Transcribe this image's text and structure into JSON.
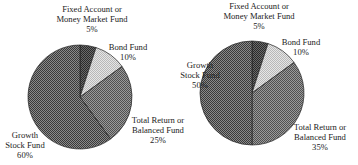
{
  "chart_data": [
    {
      "type": "pie",
      "title": "",
      "center": [
        80,
        97
      ],
      "radius": 52,
      "start_angle_deg": 0,
      "slices": [
        {
          "label": "Fixed Account or Money Market Fund",
          "value": 5,
          "pattern": "dark"
        },
        {
          "label": "Bond Fund",
          "value": 10,
          "pattern": "light"
        },
        {
          "label": "Total Return or Balanced Fund",
          "value": 25,
          "pattern": "medium"
        },
        {
          "label": "Growth Stock Fund",
          "value": 60,
          "pattern": "darkmed"
        }
      ],
      "labels": [
        {
          "lines": [
            "Fixed Account or",
            "Money Market Fund",
            "5%"
          ],
          "x": 92,
          "y": 12,
          "anchor": "middle"
        },
        {
          "lines": [
            "Bond Fund",
            "10%"
          ],
          "x": 128,
          "y": 50,
          "anchor": "middle"
        },
        {
          "lines": [
            "Total Return or",
            "Balanced Fund",
            "25%"
          ],
          "x": 158,
          "y": 123,
          "anchor": "middle"
        },
        {
          "lines": [
            "Growth",
            "Stock Fund",
            "60%"
          ],
          "x": 25,
          "y": 138,
          "anchor": "middle"
        }
      ]
    },
    {
      "type": "pie",
      "title": "",
      "center": [
        252,
        93
      ],
      "radius": 52,
      "start_angle_deg": 0,
      "slices": [
        {
          "label": "Fixed Account or Money Market Fund",
          "value": 5,
          "pattern": "dark"
        },
        {
          "label": "Bond Fund",
          "value": 10,
          "pattern": "light"
        },
        {
          "label": "Total Return or Balanced Fund",
          "value": 35,
          "pattern": "medium"
        },
        {
          "label": "Growth Stock Fund",
          "value": 50,
          "pattern": "darkmed"
        }
      ],
      "labels": [
        {
          "lines": [
            "Fixed Account or",
            "Money Market Fund",
            "5%"
          ],
          "x": 259,
          "y": 9,
          "anchor": "middle"
        },
        {
          "lines": [
            "Bond Fund",
            "10%"
          ],
          "x": 301,
          "y": 45,
          "anchor": "middle"
        },
        {
          "lines": [
            "Growth",
            "Stock Fund",
            "50%"
          ],
          "x": 200,
          "y": 68,
          "anchor": "middle"
        },
        {
          "lines": [
            "Total Return or",
            "Balanced Fund",
            "35%"
          ],
          "x": 320,
          "y": 130,
          "anchor": "middle"
        }
      ]
    }
  ],
  "patterns": {
    "dark": {
      "fg": "#2a2a2a",
      "bg": "#6a6a6a"
    },
    "darkmed": {
      "fg": "#3a3a3a",
      "bg": "#8a8a8a"
    },
    "medium": {
      "fg": "#505050",
      "bg": "#9a9a9a"
    },
    "light": {
      "fg": "#b8b8b8",
      "bg": "#e6e6e6"
    }
  }
}
